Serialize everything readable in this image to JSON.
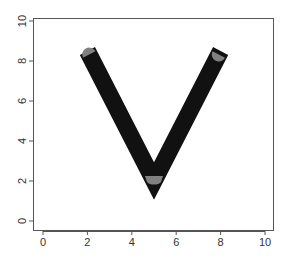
{
  "chart_data": {
    "type": "line",
    "title": "",
    "xlabel": "",
    "ylabel": "",
    "xlim": [
      0,
      10
    ],
    "ylim": [
      0,
      10
    ],
    "grid": false,
    "legend": null,
    "x_ticks": [
      "0",
      "2",
      "4",
      "6",
      "8",
      "10"
    ],
    "y_ticks": [
      "0",
      "2",
      "4",
      "6",
      "8",
      "10"
    ],
    "series": [
      {
        "name": "thick-black-line",
        "x": [
          2,
          5,
          8
        ],
        "y": [
          8.5,
          2,
          8.5
        ],
        "color": "#111111",
        "line_join": "mitre",
        "line_end": "butt"
      },
      {
        "name": "gray-overlay-line",
        "x": [
          2,
          5,
          8
        ],
        "y": [
          8.5,
          2,
          8.5
        ],
        "color": "#808080",
        "line_join": "round",
        "line_end": "round"
      }
    ]
  },
  "axes": {
    "x_tick_labels": [
      "0",
      "2",
      "4",
      "6",
      "8",
      "10"
    ],
    "y_tick_labels": [
      "0",
      "2",
      "4",
      "6",
      "8",
      "10"
    ]
  }
}
